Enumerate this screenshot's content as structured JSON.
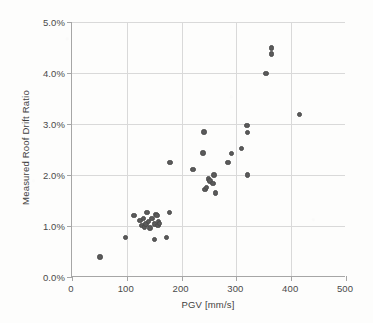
{
  "chart_data": {
    "type": "scatter",
    "title": "",
    "xlabel": "PGV [mm/s]",
    "ylabel": "Measured Roof Drift Ratio",
    "xlim": [
      0,
      500
    ],
    "ylim": [
      0,
      5
    ],
    "xticks": [
      0,
      100,
      200,
      300,
      400,
      500
    ],
    "xtick_labels": [
      "0",
      "100",
      "200",
      "300",
      "400",
      "500"
    ],
    "yticks": [
      0,
      1,
      2,
      3,
      4,
      5
    ],
    "ytick_labels": [
      "0.0%",
      "1.0%",
      "2.0%",
      "3.0%",
      "4.0%",
      "5.0%"
    ],
    "grid": "horizontal-and-vertical",
    "legend": "none",
    "marker": {
      "shape": "circle",
      "color": "#5a5a5a",
      "size_px": 5.4
    },
    "units": {
      "x": "mm/s",
      "y": "percent"
    },
    "series": [
      {
        "name": "Measured roof drift vs PGV",
        "points": [
          [
            51,
            0.39
          ],
          [
            98,
            0.78
          ],
          [
            113,
            1.21
          ],
          [
            124,
            1.11
          ],
          [
            128,
            1.01
          ],
          [
            130,
            1.15
          ],
          [
            132,
            0.98
          ],
          [
            135,
            1.04
          ],
          [
            137,
            1.27
          ],
          [
            140,
            1.09
          ],
          [
            142,
            0.96
          ],
          [
            146,
            1.15
          ],
          [
            150,
            1.04
          ],
          [
            151,
            0.73
          ],
          [
            153,
            1.23
          ],
          [
            155,
            1.21
          ],
          [
            157,
            1.01
          ],
          [
            158,
            1.09
          ],
          [
            160,
            1.05
          ],
          [
            172,
            0.78
          ],
          [
            178,
            1.26
          ],
          [
            179,
            2.25
          ],
          [
            221,
            2.11
          ],
          [
            239,
            2.43
          ],
          [
            241,
            2.84
          ],
          [
            243,
            1.72
          ],
          [
            245,
            1.75
          ],
          [
            249,
            1.92
          ],
          [
            252,
            1.88
          ],
          [
            257,
            1.83
          ],
          [
            259,
            2.0
          ],
          [
            262,
            1.65
          ],
          [
            285,
            2.25
          ],
          [
            291,
            2.42
          ],
          [
            309,
            2.52
          ],
          [
            319,
            2.97
          ],
          [
            320,
            2.83
          ],
          [
            320,
            2.0
          ],
          [
            354,
            3.99
          ],
          [
            364,
            4.49
          ],
          [
            364,
            4.37
          ],
          [
            415,
            3.19
          ]
        ]
      }
    ]
  },
  "axes": {
    "x_title": "PGV [mm/s]",
    "y_title": "Measured Roof Drift Ratio"
  }
}
